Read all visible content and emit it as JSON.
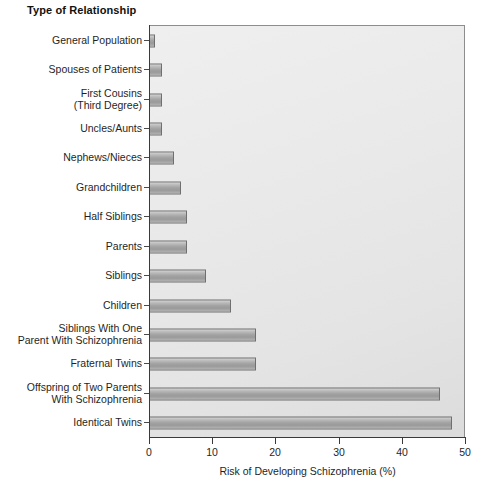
{
  "chart_data": {
    "type": "bar",
    "orientation": "horizontal",
    "title": "Type of Relationship",
    "xlabel": "Risk of Developing Schizophrenia (%)",
    "ylabel": "Type of Relationship",
    "xlim": [
      0,
      50
    ],
    "xticks": [
      0,
      10,
      20,
      30,
      40,
      50
    ],
    "xtick_labels": [
      "0",
      "10",
      "20",
      "30",
      "40",
      "50"
    ],
    "grid": false,
    "legend": null,
    "bar_color": "#a2a2a2",
    "bar_edge_color": "#6f6f6f",
    "plot_background": "#eaeaea",
    "categories": [
      "General Population",
      "Spouses of Patients",
      "First Cousins\n(Third Degree)",
      "Uncles/Aunts",
      "Nephews/Nieces",
      "Grandchildren",
      "Half Siblings",
      "Parents",
      "Siblings",
      "Children",
      "Siblings With One\nParent With Schizophrenia",
      "Fraternal Twins",
      "Offspring of Two Parents\nWith Schizophrenia",
      "Identical Twins"
    ],
    "values": [
      1,
      2,
      2,
      2,
      4,
      5,
      6,
      6,
      9,
      13,
      17,
      17,
      46,
      48
    ]
  }
}
